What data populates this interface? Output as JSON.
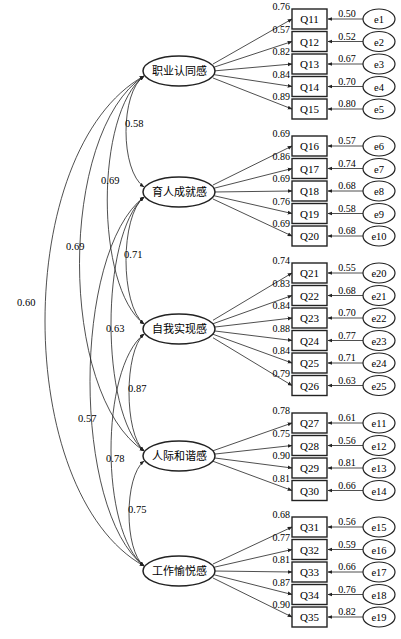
{
  "figure": {
    "caption": "",
    "stroke_color": "#222222",
    "background": "#ffffff"
  },
  "factors": [
    {
      "id": "F1",
      "label": "职业认同感",
      "cy": 71,
      "items": [
        {
          "name": "Q11",
          "loading": "0.76",
          "error": "e1",
          "error_value": "0.50"
        },
        {
          "name": "Q12",
          "loading": "0.57",
          "error": "e2",
          "error_value": "0.52"
        },
        {
          "name": "Q13",
          "loading": "0.82",
          "error": "e3",
          "error_value": "0.67"
        },
        {
          "name": "Q14",
          "loading": "0.84",
          "error": "e4",
          "error_value": "0.70"
        },
        {
          "name": "Q15",
          "loading": "0.89",
          "error": "e5",
          "error_value": "0.80"
        }
      ],
      "first_top": 9
    },
    {
      "id": "F2",
      "label": "育人成就感",
      "cy": 192,
      "items": [
        {
          "name": "Q16",
          "loading": "0.69",
          "error": "e6",
          "error_value": "0.57"
        },
        {
          "name": "Q17",
          "loading": "0.86",
          "error": "e7",
          "error_value": "0.74"
        },
        {
          "name": "Q18",
          "loading": "0.69",
          "error": "e8",
          "error_value": "0.68"
        },
        {
          "name": "Q19",
          "loading": "0.76",
          "error": "e9",
          "error_value": "0.58"
        },
        {
          "name": "Q20",
          "loading": "0.69",
          "error": "e10",
          "error_value": "0.68"
        }
      ],
      "first_top": 136
    },
    {
      "id": "F3",
      "label": "自我实现感",
      "cy": 329,
      "items": [
        {
          "name": "Q21",
          "loading": "0.74",
          "error": "e20",
          "error_value": "0.55"
        },
        {
          "name": "Q22",
          "loading": "0.83",
          "error": "e21",
          "error_value": "0.68"
        },
        {
          "name": "Q23",
          "loading": "0.84",
          "error": "e22",
          "error_value": "0.70"
        },
        {
          "name": "Q24",
          "loading": "0.88",
          "error": "e23",
          "error_value": "0.77"
        },
        {
          "name": "Q25",
          "loading": "0.84",
          "error": "e24",
          "error_value": "0.71"
        },
        {
          "name": "Q26",
          "loading": "0.79",
          "error": "e25",
          "error_value": "0.63"
        }
      ],
      "first_top": 263
    },
    {
      "id": "F4",
      "label": "人际和谐感",
      "cy": 456,
      "items": [
        {
          "name": "Q27",
          "loading": "0.78",
          "error": "e11",
          "error_value": "0.61"
        },
        {
          "name": "Q28",
          "loading": "0.75",
          "error": "e12",
          "error_value": "0.56"
        },
        {
          "name": "Q29",
          "loading": "0.90",
          "error": "e13",
          "error_value": "0.81"
        },
        {
          "name": "Q30",
          "loading": "0.81",
          "error": "e14",
          "error_value": "0.66"
        }
      ],
      "first_top": 413
    },
    {
      "id": "F5",
      "label": "工作愉悦感",
      "cy": 571,
      "items": [
        {
          "name": "Q31",
          "loading": "0.68",
          "error": "e15",
          "error_value": "0.56"
        },
        {
          "name": "Q32",
          "loading": "0.77",
          "error": "e16",
          "error_value": "0.59"
        },
        {
          "name": "Q33",
          "loading": "0.81",
          "error": "e17",
          "error_value": "0.66"
        },
        {
          "name": "Q34",
          "loading": "0.87",
          "error": "e18",
          "error_value": "0.76"
        },
        {
          "name": "Q35",
          "loading": "0.90",
          "error": "e19",
          "error_value": "0.82"
        }
      ],
      "first_top": 517
    }
  ],
  "correlations": [
    {
      "from": "F1",
      "to": "F2",
      "value": "0.58",
      "cx": 120,
      "lx": 125,
      "ly": 127
    },
    {
      "from": "F1",
      "to": "F3",
      "value": "0.69",
      "cx": 95,
      "lx": 101,
      "ly": 184
    },
    {
      "from": "F1",
      "to": "F4",
      "value": "0.69",
      "cx": 58,
      "lx": 66,
      "ly": 250
    },
    {
      "from": "F1",
      "to": "F5",
      "value": "0.60",
      "cx": 12,
      "lx": 17,
      "ly": 306
    },
    {
      "from": "F2",
      "to": "F3",
      "value": "0.71",
      "cx": 120,
      "lx": 124,
      "ly": 258
    },
    {
      "from": "F2",
      "to": "F4",
      "value": "0.63",
      "cx": 100,
      "lx": 106,
      "ly": 332
    },
    {
      "from": "F2",
      "to": "F5",
      "value": "0.57",
      "cx": 72,
      "lx": 78,
      "ly": 422
    },
    {
      "from": "F3",
      "to": "F4",
      "value": "0.87",
      "cx": 124,
      "lx": 128,
      "ly": 392
    },
    {
      "from": "F3",
      "to": "F5",
      "value": "0.78",
      "cx": 100,
      "lx": 106,
      "ly": 462
    },
    {
      "from": "F4",
      "to": "F5",
      "value": "0.75",
      "cx": 124,
      "lx": 128,
      "ly": 513
    }
  ],
  "layout": {
    "ellipse_cx": 179,
    "ellipse_rx": 36,
    "ellipse_ry": 15,
    "box_x": 292,
    "box_w": 35,
    "box_h": 20,
    "row_step": 22.5,
    "err_cx": 379,
    "err_rx": 16,
    "err_ry": 10
  }
}
